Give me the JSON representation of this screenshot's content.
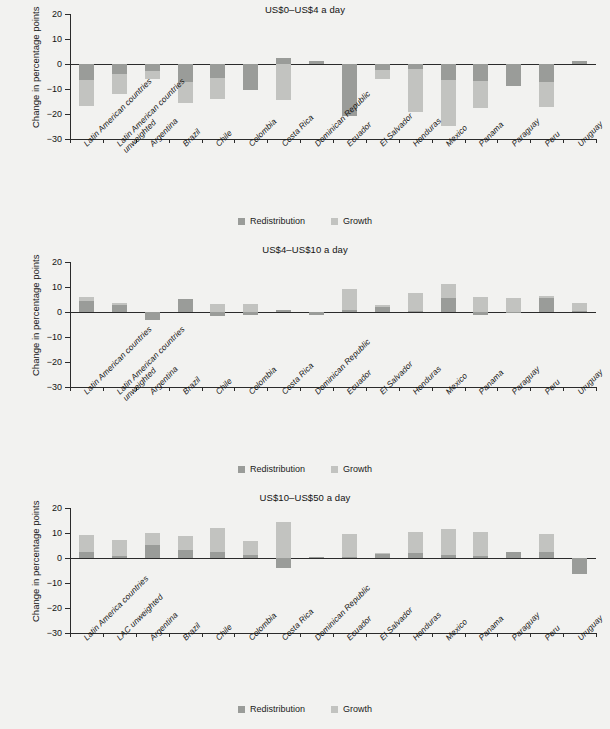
{
  "figure": {
    "ylabel": "Change in percentage points",
    "legend": {
      "redistribution": "Redistribution",
      "growth": "Growth"
    },
    "colors": {
      "redistribution": "#9a9c99",
      "growth": "#c2c3c0",
      "background": "#f2f2f0",
      "axis": "#2b2b2b"
    }
  },
  "chart_data": [
    {
      "type": "bar",
      "title": "US$0–US$4  a day",
      "xlabel": "",
      "ylabel": "Change in percentage points",
      "ylim": [
        -30,
        20
      ],
      "yticks": [
        20,
        10,
        0,
        -10,
        -20,
        -30
      ],
      "yticklabels": [
        "20",
        "10",
        "0",
        "−10",
        "−20",
        "−30"
      ],
      "grid": false,
      "legend_position": "bottom-center",
      "stacked": true,
      "categories": [
        "Latin American countries",
        "Latin American countries unweighted",
        "Argentina",
        "Brazil",
        "Chile",
        "Colombia",
        "Costa Rica",
        "Dominican Republic",
        "Ecuador",
        "El Salvador",
        "Honduras",
        "Mexico",
        "Panama",
        "Paraguay",
        "Peru",
        "Uruguay"
      ],
      "series": [
        {
          "name": "Redistribution",
          "values": [
            -6.2,
            -4.1,
            -2.6,
            -7.3,
            -5.4,
            -10.4,
            2.6,
            1.1,
            -20.6,
            -2.3,
            -2.1,
            -6.4,
            -6.8,
            -8.6,
            -7.1,
            1.3
          ]
        },
        {
          "name": "Growth",
          "values": [
            -10.7,
            -8.0,
            -3.5,
            -8.2,
            -8.7,
            0.7,
            -17.0,
            0.0,
            0.0,
            -3.5,
            -17.1,
            -18.3,
            -10.9,
            0.0,
            -10.1,
            0.0
          ]
        }
      ],
      "totals": [
        -16.9,
        -12.1,
        -6.1,
        -15.5,
        -14.1,
        -10.4,
        -14.4,
        1.1,
        -20.6,
        -5.8,
        -19.2,
        -24.7,
        -17.7,
        -8.6,
        -17.2,
        1.3
      ]
    },
    {
      "type": "bar",
      "title": "US$4–US$10  a day",
      "xlabel": "",
      "ylabel": "Change in percentage points",
      "ylim": [
        -30,
        20
      ],
      "yticks": [
        20,
        10,
        0,
        -10,
        -20,
        -30
      ],
      "yticklabels": [
        "20",
        "10",
        "0",
        "−10",
        "−20",
        "−30"
      ],
      "grid": false,
      "legend_position": "bottom-center",
      "stacked": true,
      "categories": [
        "Latin American countries",
        "Latin American countries unweighted",
        "Argentina",
        "Brazil",
        "Chile",
        "Colombia",
        "Costa Rica",
        "Dominican Republic",
        "Ecuador",
        "El Salvador",
        "Honduras",
        "Mexico",
        "Panama",
        "Paraguay",
        "Peru",
        "Uruguay"
      ],
      "series": [
        {
          "name": "Redistribution",
          "values": [
            4.4,
            2.9,
            -3.3,
            5.2,
            -1.6,
            -1.2,
            0.9,
            -1.0,
            0.9,
            1.9,
            0.4,
            5.8,
            -1.1,
            0.2,
            5.5,
            0.3
          ]
        },
        {
          "name": "Growth",
          "values": [
            1.5,
            0.8,
            0.0,
            0.0,
            4.8,
            4.4,
            0.0,
            0.0,
            8.5,
            0.8,
            7.2,
            5.5,
            7.3,
            5.6,
            1.1,
            3.5
          ]
        }
      ],
      "totals": [
        5.9,
        3.7,
        -3.3,
        5.2,
        3.2,
        3.2,
        0.9,
        -1.0,
        9.4,
        2.7,
        7.6,
        11.3,
        6.2,
        5.8,
        6.6,
        3.8
      ]
    },
    {
      "type": "bar",
      "title": "US$10–US$50 a day",
      "xlabel": "",
      "ylabel": "Change in percentage points",
      "ylim": [
        -30,
        20
      ],
      "yticks": [
        20,
        10,
        0,
        -10,
        -20,
        -30
      ],
      "yticklabels": [
        "20",
        "10",
        "0",
        "−10",
        "−20",
        "−30"
      ],
      "grid": false,
      "legend_position": "bottom-center",
      "stacked": true,
      "categories": [
        "Latin America countries",
        "LAC unweighted",
        "Argentina",
        "Brazil",
        "Chile",
        "Colombia",
        "Costa Rica",
        "Dominican Republic",
        "Ecuador",
        "El Salvador",
        "Honduras",
        "Mexico",
        "Panama",
        "Paraguay",
        "Peru",
        "Uruguay"
      ],
      "series": [
        {
          "name": "Redistribution",
          "values": [
            2.6,
            0.9,
            5.2,
            3.2,
            2.4,
            1.2,
            -3.8,
            0.4,
            0.4,
            1.7,
            1.9,
            1.3,
            0.8,
            2.6,
            2.3,
            -6.3
          ]
        },
        {
          "name": "Growth",
          "values": [
            6.7,
            6.2,
            4.7,
            5.7,
            9.7,
            5.5,
            14.3,
            0.0,
            9.1,
            0.3,
            8.4,
            10.2,
            9.8,
            0.0,
            7.3,
            0.0
          ]
        }
      ],
      "totals": [
        9.3,
        7.1,
        9.9,
        8.9,
        12.1,
        6.7,
        14.3,
        0.4,
        9.5,
        2.0,
        10.3,
        11.5,
        10.6,
        2.6,
        9.6,
        -6.3
      ]
    }
  ]
}
